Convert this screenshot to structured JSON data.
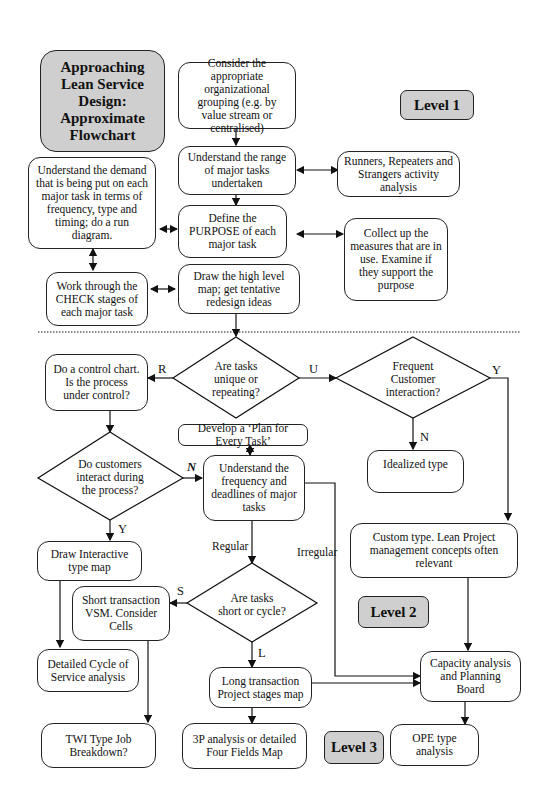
{
  "title": "Approaching Lean Service Design: Approximate Flowchart",
  "levels": {
    "level1": "Level 1",
    "level2": "Level 2",
    "level3": "Level 3"
  },
  "nodes": {
    "organizational_grouping": "Consider the appropriate organizational grouping (e.g. by value stream or centralised)",
    "range_of_tasks": "Understand the range of major tasks undertaken",
    "runners_repeaters": "Runners, Repeaters and Strangers activity analysis",
    "understand_demand": "Understand the demand that is being put on each major task in terms of frequency, type and timing; do a run diagram.",
    "define_purpose": "Define the PURPOSE of each major task",
    "collect_measures": "Collect up the measures that are in use. Examine if they support the purpose",
    "check_stages": "Work through the CHECK stages of each major task",
    "high_level_map": "Draw the high level map; get tentative redesign ideas",
    "control_chart": "Do a control chart. Is the process under control?",
    "plan_every_task": "Develop a ‘Plan for Every Task’",
    "idealized_type": "Idealized type",
    "frequency_deadlines": "Understand the frequency and deadlines of major tasks",
    "interactive_map": "Draw Interactive type map",
    "custom_type": "Custom type. Lean Project management concepts often relevant",
    "short_transaction": "Short transaction VSM. Consider Cells",
    "cycle_of_service": "Detailed Cycle of Service analysis",
    "long_transaction": "Long transaction Project stages map",
    "capacity_analysis": "Capacity analysis and Planning Board",
    "twi_type": "TWI Type Job Breakdown?",
    "three_p": "3P analysis or detailed Four Fields Map",
    "ope_type": "OPE type analysis"
  },
  "decisions": {
    "unique_or_repeating": "Are tasks unique or repeating?",
    "frequent_customer": "Frequent Customer interaction?",
    "customers_interact": "Do customers interact during the process?",
    "short_or_cycle": "Are tasks short or cycle?"
  },
  "edge_labels": {
    "r": "R",
    "u": "U",
    "y1": "Y",
    "n1": "N",
    "n2": "N",
    "y2": "Y",
    "regular": "Regular",
    "irregular": "Irregular",
    "s": "S",
    "l": "L"
  }
}
